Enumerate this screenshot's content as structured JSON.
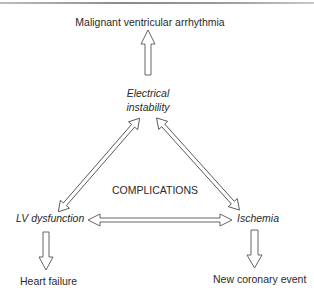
{
  "diagram": {
    "top_outcome": "Malignant ventricular arrhythmia",
    "nodes": {
      "electrical_instability": {
        "line1": "Electrical",
        "line2": "instability"
      },
      "lv_dysfunction": "LV dysfunction",
      "ischemia": "Ischemia"
    },
    "center_label": "COMPLICATIONS",
    "outcomes": {
      "left": "Heart failure",
      "right": "New coronary event"
    },
    "edges": [
      {
        "from": "Electrical instability",
        "to": "Malignant ventricular arrhythmia",
        "type": "single-arrow"
      },
      {
        "from": "Electrical instability",
        "to": "LV dysfunction",
        "type": "double-arrow"
      },
      {
        "from": "Electrical instability",
        "to": "Ischemia",
        "type": "double-arrow"
      },
      {
        "from": "LV dysfunction",
        "to": "Ischemia",
        "type": "double-arrow"
      },
      {
        "from": "LV dysfunction",
        "to": "Heart failure",
        "type": "single-arrow"
      },
      {
        "from": "Ischemia",
        "to": "New coronary event",
        "type": "single-arrow"
      }
    ],
    "colors": {
      "stroke": "#555555",
      "text": "#2a2a2a",
      "rule": "#8a8a8a"
    }
  }
}
